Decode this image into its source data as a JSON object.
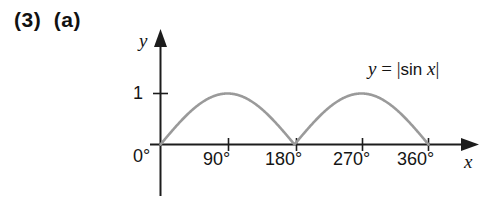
{
  "problem": {
    "label": "(3)  (a)"
  },
  "figure": {
    "name": "graph-absolute-sine",
    "equation": {
      "lhs": "y",
      "equals": "=",
      "open_bar": "|",
      "function": "sin",
      "variable": "x",
      "close_bar": "|",
      "full_text": "y = |sin x|"
    },
    "axes": {
      "x_name": "x",
      "y_name": "y",
      "x_tick_labels": [
        "0°",
        "90°",
        "180°",
        "270°",
        "360°"
      ],
      "y_tick_labels": [
        "1"
      ]
    },
    "colors": {
      "curve": "#9a9a9a",
      "axis": "#1c1c1c",
      "text": "#141414",
      "background": "#ffffff"
    }
  },
  "chart_data": {
    "type": "line",
    "title": "",
    "subtitle": "",
    "xlabel": "x",
    "ylabel": "y",
    "xlim": [
      0,
      390
    ],
    "ylim": [
      0,
      1.35
    ],
    "grid": false,
    "legend": null,
    "annotations": [
      "y = |sin x|"
    ],
    "x_ticks": [
      0,
      90,
      180,
      270,
      360
    ],
    "x_tick_labels": [
      "0°",
      "90°",
      "180°",
      "270°",
      "360°"
    ],
    "y_ticks": [
      1
    ],
    "y_tick_labels": [
      "1"
    ],
    "series": [
      {
        "name": "y = |sin x|",
        "color": "#9a9a9a",
        "x": [
          0,
          10,
          20,
          30,
          40,
          50,
          60,
          70,
          80,
          90,
          100,
          110,
          120,
          130,
          140,
          150,
          160,
          170,
          180,
          190,
          200,
          210,
          220,
          230,
          240,
          250,
          260,
          270,
          280,
          290,
          300,
          310,
          320,
          330,
          340,
          350,
          360
        ],
        "y": [
          0,
          0.174,
          0.342,
          0.5,
          0.643,
          0.766,
          0.866,
          0.94,
          0.985,
          1,
          0.985,
          0.94,
          0.866,
          0.766,
          0.643,
          0.5,
          0.342,
          0.174,
          0,
          0.174,
          0.342,
          0.5,
          0.643,
          0.766,
          0.866,
          0.94,
          0.985,
          1,
          0.985,
          0.94,
          0.866,
          0.766,
          0.643,
          0.5,
          0.342,
          0.174,
          0
        ]
      }
    ]
  }
}
